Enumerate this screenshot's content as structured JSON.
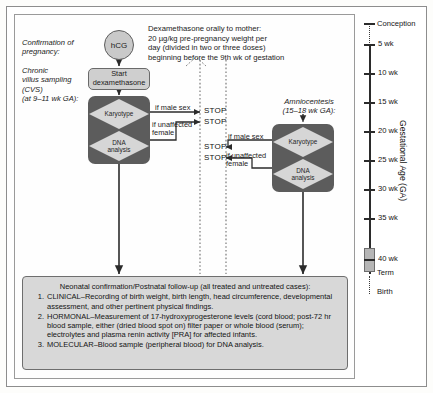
{
  "annotations": {
    "confirmation": "Confirmation of\npregnancy:",
    "cvs": "Chronic\nvillus sampling\n(CVS)\n(at 9–11 wk GA):",
    "dexamethasone": "Dexamethasone orally to mother:\n20 µg/kg pre-pregnancy weight per\nday (divided in two or three doses)\nbeginning before the 9th wk of gestation",
    "amniocentesis": "Amniocentesis\n(15–18 wk GA):"
  },
  "nodes": {
    "hcg": "hCG",
    "start_dexamethasone_line1": "Start",
    "start_dexamethasone_line2": "dexamethasone",
    "karyotype": "Karyotype",
    "dna_line1": "DNA",
    "dna_line2": "analysis"
  },
  "branches": {
    "stop_label": "STOP",
    "if_male_sex": "if male sex",
    "if_unaffected_female_line1": "if unaffected",
    "if_unaffected_female_line2": "female"
  },
  "bottom_panel": {
    "title": "Neonatal confirmation/Postnatal follow-up (all treated and untreated cases):",
    "items": [
      {
        "number": "1.",
        "text": "CLINICAL–Recording of birth weight, birth length, head circumference, developmental assessment, and other pertinent physical findings."
      },
      {
        "number": "2.",
        "text": "HORMONAL–Measurement of 17-hydroxyprogesterone levels (cord blood; post-72 hr blood sample, either (dried blood spot on) filter paper or whole blood (serum); electrolytes and plasma renin activity [PRA] for affected infants."
      },
      {
        "number": "3.",
        "text": "MOLECULAR–Blood sample (peripheral blood) for DNA analysis."
      }
    ]
  },
  "ga_scale": {
    "axis_title": "Gestational Age (GA)",
    "conception": "Conception",
    "ticks": [
      "5 wk",
      "10 wk",
      "15 wk",
      "20 wk",
      "25 wk",
      "30 wk",
      "35 wk",
      "40 wk"
    ],
    "term": "Term",
    "birth": "Birth"
  },
  "colors": {
    "node_dark": "#5c5c5c",
    "diamond_fill": "#d6d6d6",
    "hcg_fill": "#c9c9c9",
    "panel_fill": "#d8d8d8",
    "line": "#2b2b2b"
  }
}
